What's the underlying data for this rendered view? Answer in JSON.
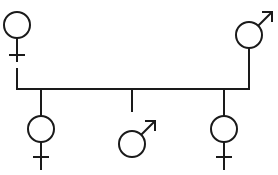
{
  "diagram": {
    "title": "Family pedigree diagram",
    "type": "genogram",
    "canvas": {
      "width": 278,
      "height": 175
    },
    "background_color": "#ffffff",
    "line_color": "#1a1a1a",
    "line_width": 2,
    "generations": [
      {
        "label": "Parents",
        "members": [
          {
            "id": "parent-female",
            "role": "mother",
            "sex": "female",
            "symbol": "venus",
            "marker": "none",
            "center": {
              "x": 17,
              "y": 25
            },
            "radius": 13
          },
          {
            "id": "parent-male",
            "role": "father",
            "sex": "male",
            "symbol": "mars",
            "marker": "arrow",
            "center": {
              "x": 249,
              "y": 35
            },
            "radius": 13
          }
        ]
      },
      {
        "label": "Children",
        "members": [
          {
            "id": "child-1-female",
            "role": "daughter",
            "sex": "female",
            "symbol": "venus",
            "marker": "none",
            "center": {
              "x": 41,
              "y": 129
            },
            "radius": 13
          },
          {
            "id": "child-2-male",
            "role": "son",
            "sex": "male",
            "symbol": "mars",
            "marker": "arrow",
            "center": {
              "x": 132,
              "y": 144
            },
            "radius": 13
          },
          {
            "id": "child-3-female",
            "role": "daughter",
            "sex": "female",
            "symbol": "venus",
            "marker": "none",
            "center": {
              "x": 224,
              "y": 129
            },
            "radius": 13
          }
        ]
      }
    ],
    "connectors": {
      "sibling_line_y": 89,
      "sibling_line_x_start": 17,
      "sibling_line_x_end": 249,
      "drop_stems_x": [
        41,
        132,
        224
      ]
    }
  }
}
